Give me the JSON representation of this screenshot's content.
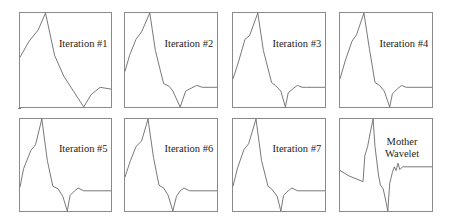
{
  "figure": {
    "layout": {
      "rows": 2,
      "cols": 4
    }
  },
  "chart_data": {
    "type": "line",
    "title": "",
    "xlabel": "",
    "ylabel": "",
    "grid": false,
    "axes_ticks": "none",
    "panels": [
      {
        "label": "Iteration #1",
        "label_pos": [
          0.68,
          0.32
        ],
        "points": [
          [
            0,
            0.53
          ],
          [
            0.1,
            0.7
          ],
          [
            0.2,
            0.82
          ],
          [
            0.28,
            1.0
          ],
          [
            0.38,
            0.55
          ],
          [
            0.48,
            0.33
          ],
          [
            0.58,
            0.18
          ],
          [
            0.7,
            0.0
          ],
          [
            0.78,
            0.13
          ],
          [
            0.88,
            0.21
          ],
          [
            1.0,
            0.19
          ]
        ]
      },
      {
        "label": "Iteration #2",
        "label_pos": [
          0.68,
          0.32
        ],
        "points": [
          [
            0,
            0.38
          ],
          [
            0.05,
            0.55
          ],
          [
            0.12,
            0.72
          ],
          [
            0.18,
            0.8
          ],
          [
            0.27,
            1.0
          ],
          [
            0.33,
            0.6
          ],
          [
            0.42,
            0.25
          ],
          [
            0.48,
            0.22
          ],
          [
            0.52,
            0.17
          ],
          [
            0.6,
            0.0
          ],
          [
            0.66,
            0.17
          ],
          [
            0.72,
            0.2
          ],
          [
            0.78,
            0.23
          ],
          [
            0.84,
            0.21
          ],
          [
            1.0,
            0.21
          ]
        ]
      },
      {
        "label": "Iteration #3",
        "label_pos": [
          0.68,
          0.32
        ],
        "points": [
          [
            0,
            0.3
          ],
          [
            0.06,
            0.48
          ],
          [
            0.13,
            0.72
          ],
          [
            0.18,
            0.76
          ],
          [
            0.27,
            1.0
          ],
          [
            0.33,
            0.6
          ],
          [
            0.42,
            0.26
          ],
          [
            0.46,
            0.23
          ],
          [
            0.52,
            0.17
          ],
          [
            0.57,
            0.0
          ],
          [
            0.6,
            0.15
          ],
          [
            0.66,
            0.2
          ],
          [
            0.7,
            0.23
          ],
          [
            0.75,
            0.21
          ],
          [
            0.8,
            0.21
          ],
          [
            1.0,
            0.21
          ]
        ]
      },
      {
        "label": "Iteration #4",
        "label_pos": [
          0.68,
          0.32
        ],
        "points": [
          [
            0,
            0.3
          ],
          [
            0.06,
            0.5
          ],
          [
            0.13,
            0.7
          ],
          [
            0.18,
            0.77
          ],
          [
            0.26,
            1.0
          ],
          [
            0.32,
            0.62
          ],
          [
            0.38,
            0.26
          ],
          [
            0.43,
            0.23
          ],
          [
            0.48,
            0.17
          ],
          [
            0.54,
            0.0
          ],
          [
            0.57,
            0.14
          ],
          [
            0.63,
            0.2
          ],
          [
            0.67,
            0.23
          ],
          [
            0.72,
            0.21
          ],
          [
            1.0,
            0.21
          ]
        ]
      },
      {
        "label": "Iteration #5",
        "label_pos": [
          0.68,
          0.32
        ],
        "points": [
          [
            0,
            0.26
          ],
          [
            0.04,
            0.46
          ],
          [
            0.12,
            0.66
          ],
          [
            0.17,
            0.72
          ],
          [
            0.24,
            1.0
          ],
          [
            0.3,
            0.55
          ],
          [
            0.36,
            0.27
          ],
          [
            0.42,
            0.24
          ],
          [
            0.47,
            0.16
          ],
          [
            0.52,
            0.0
          ],
          [
            0.55,
            0.17
          ],
          [
            0.6,
            0.22
          ],
          [
            0.64,
            0.25
          ],
          [
            0.7,
            0.22
          ],
          [
            1.0,
            0.22
          ]
        ]
      },
      {
        "label": "Iteration #6",
        "label_pos": [
          0.68,
          0.32
        ],
        "points": [
          [
            0,
            0.37
          ],
          [
            0.06,
            0.55
          ],
          [
            0.12,
            0.7
          ],
          [
            0.18,
            0.76
          ],
          [
            0.25,
            1.0
          ],
          [
            0.31,
            0.58
          ],
          [
            0.37,
            0.28
          ],
          [
            0.42,
            0.25
          ],
          [
            0.47,
            0.17
          ],
          [
            0.52,
            0.0
          ],
          [
            0.56,
            0.16
          ],
          [
            0.6,
            0.22
          ],
          [
            0.64,
            0.25
          ],
          [
            0.7,
            0.22
          ],
          [
            1.0,
            0.22
          ]
        ]
      },
      {
        "label": "Iteration #7",
        "label_pos": [
          0.68,
          0.32
        ],
        "points": [
          [
            0,
            0.27
          ],
          [
            0.05,
            0.47
          ],
          [
            0.12,
            0.67
          ],
          [
            0.17,
            0.73
          ],
          [
            0.25,
            1.0
          ],
          [
            0.31,
            0.55
          ],
          [
            0.38,
            0.27
          ],
          [
            0.42,
            0.24
          ],
          [
            0.48,
            0.16
          ],
          [
            0.52,
            0.0
          ],
          [
            0.55,
            0.17
          ],
          [
            0.6,
            0.22
          ],
          [
            0.64,
            0.25
          ],
          [
            0.7,
            0.22
          ],
          [
            1.0,
            0.22
          ]
        ]
      },
      {
        "label": "Mother\nWavelet",
        "label_pos": [
          0.66,
          0.24
        ],
        "points": [
          [
            0,
            0.44
          ],
          [
            0.1,
            0.38
          ],
          [
            0.25,
            0.32
          ],
          [
            0.27,
            0.6
          ],
          [
            0.3,
            0.7
          ],
          [
            0.33,
            0.86
          ],
          [
            0.36,
            1.0
          ],
          [
            0.38,
            0.7
          ],
          [
            0.42,
            0.38
          ],
          [
            0.44,
            0.28
          ],
          [
            0.47,
            0.24
          ],
          [
            0.5,
            0.1
          ],
          [
            0.52,
            0.0
          ],
          [
            0.54,
            0.3
          ],
          [
            0.57,
            0.42
          ],
          [
            0.59,
            0.48
          ],
          [
            0.61,
            0.44
          ],
          [
            0.63,
            0.52
          ],
          [
            0.65,
            0.45
          ],
          [
            0.68,
            0.48
          ],
          [
            1.0,
            0.48
          ]
        ]
      }
    ]
  }
}
